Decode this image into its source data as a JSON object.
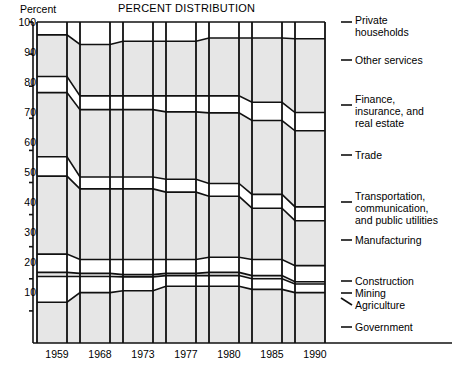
{
  "chart_data": {
    "type": "area",
    "title": "PERCENT DISTRIBUTION",
    "ylabel": "Percent",
    "xlabel": "",
    "grid": false,
    "legend_position": "right-inline-labels",
    "ylim": [
      0,
      100
    ],
    "yticks": [
      0,
      10,
      20,
      30,
      40,
      50,
      60,
      70,
      80,
      90,
      100
    ],
    "ytick_labels": [
      "",
      "10",
      "20",
      "30",
      "40",
      "50",
      "60",
      "70",
      "80",
      "90",
      "100"
    ],
    "categories": [
      "1959",
      "1968",
      "1973",
      "1977",
      "1980",
      "1985",
      "1990"
    ],
    "stack_order_bottom_to_top": [
      "Government",
      "Agriculture",
      "Mining",
      "Construction",
      "Manufacturing",
      "Transportation, communication, and public utilities",
      "Trade",
      "Finance, insurance, and real estate",
      "Other services",
      "Private households"
    ],
    "series": [
      {
        "name": "Government",
        "values": [
          12.7,
          15.7,
          16.3,
          17.7,
          17.7,
          16.7,
          15.7
        ]
      },
      {
        "name": "Agriculture",
        "values": [
          8.0,
          5.0,
          4.3,
          3.3,
          3.3,
          3.3,
          2.7
        ]
      },
      {
        "name": "Mining",
        "values": [
          1.3,
          1.0,
          0.7,
          0.7,
          1.0,
          1.0,
          0.7
        ]
      },
      {
        "name": "Construction",
        "values": [
          5.7,
          4.3,
          4.7,
          4.3,
          4.7,
          5.0,
          5.0
        ]
      },
      {
        "name": "Manufacturing",
        "values": [
          24.3,
          22.0,
          22.0,
          21.0,
          19.0,
          16.0,
          14.0
        ]
      },
      {
        "name": "Transportation, communication, and public utilities",
        "values": [
          6.0,
          3.7,
          3.7,
          4.0,
          4.0,
          4.3,
          4.3
        ]
      },
      {
        "name": "Trade",
        "values": [
          20.0,
          21.0,
          21.0,
          21.0,
          22.0,
          23.0,
          23.7
        ]
      },
      {
        "name": "Finance, insurance, and real estate",
        "values": [
          5.0,
          4.3,
          4.3,
          5.0,
          5.3,
          5.7,
          5.7
        ]
      },
      {
        "name": "Other services",
        "values": [
          13.0,
          16.0,
          17.0,
          17.0,
          18.0,
          20.0,
          23.0
        ]
      },
      {
        "name": "Private households",
        "values": [
          4.0,
          3.0,
          2.3,
          2.3,
          2.0,
          2.0,
          2.3
        ]
      }
    ],
    "cumulative_tops": [
      {
        "band": "Government",
        "tops": [
          12.7,
          15.7,
          16.3,
          17.7,
          17.7,
          16.7,
          15.7
        ]
      },
      {
        "band": "Agriculture",
        "tops": [
          20.7,
          20.7,
          20.6,
          21.0,
          21.0,
          20.0,
          18.4
        ]
      },
      {
        "band": "Mining",
        "tops": [
          22.0,
          21.7,
          21.3,
          21.7,
          22.0,
          21.0,
          19.1
        ]
      },
      {
        "band": "Construction",
        "tops": [
          27.7,
          26.0,
          26.0,
          26.0,
          26.7,
          26.0,
          24.1
        ]
      },
      {
        "band": "Manufacturing",
        "tops": [
          52.0,
          48.0,
          48.0,
          47.0,
          45.7,
          42.0,
          38.1
        ]
      },
      {
        "band": "Transportation",
        "tops": [
          58.0,
          51.7,
          51.7,
          51.0,
          49.7,
          46.3,
          42.4
        ]
      },
      {
        "band": "Trade",
        "tops": [
          78.0,
          72.7,
          72.7,
          72.0,
          71.7,
          69.3,
          66.1
        ]
      },
      {
        "band": "Finance",
        "tops": [
          83.0,
          77.0,
          77.0,
          77.0,
          77.0,
          75.0,
          71.8
        ]
      },
      {
        "band": "Other services",
        "tops": [
          96.0,
          93.0,
          94.0,
          94.0,
          95.0,
          95.0,
          94.8
        ]
      },
      {
        "band": "Private households",
        "tops": [
          100,
          100,
          100,
          100,
          100,
          100,
          100
        ]
      }
    ],
    "annotations": [
      {
        "label": "Private households",
        "lines": [
          "Private",
          "households"
        ]
      },
      {
        "label": "Other services",
        "lines": [
          "Other services"
        ]
      },
      {
        "label": "Finance, insurance, and real estate",
        "lines": [
          "Finance,",
          "insurance, and",
          "real estate"
        ]
      },
      {
        "label": "Trade",
        "lines": [
          "Trade"
        ]
      },
      {
        "label": "Transportation, communication, and public utilities",
        "lines": [
          "Transportation,",
          "communication,",
          "and public utilities"
        ]
      },
      {
        "label": "Manufacturing",
        "lines": [
          "Manufacturing"
        ]
      },
      {
        "label": "Construction",
        "lines": [
          "Construction"
        ]
      },
      {
        "label": "Mining",
        "lines": [
          "Mining"
        ]
      },
      {
        "label": "Agriculture",
        "lines": [
          "Agriculture"
        ]
      },
      {
        "label": "Government",
        "lines": [
          "Government"
        ]
      }
    ],
    "colors": {
      "band_fill_alt": "#e6e6e6",
      "band_fill_base": "#ffffff",
      "stroke": "#111111",
      "axis": "#111111",
      "text": "#111111"
    }
  },
  "labels": {
    "y_axis_title": "Percent",
    "chart_title": "PERCENT DISTRIBUTION",
    "tick_100": "100",
    "tick_90": "90",
    "tick_80": "80",
    "tick_70": "70",
    "tick_60": "60",
    "tick_50": "50",
    "tick_40": "40",
    "tick_30": "30",
    "tick_20": "20",
    "tick_10": "10",
    "year_1959": "1959",
    "year_1968": "1968",
    "year_1973": "1973",
    "year_1977": "1977",
    "year_1980": "1980",
    "year_1985": "1985",
    "year_1990": "1990",
    "cat_private_1": "Private",
    "cat_private_2": "households",
    "cat_other_services": "Other services",
    "cat_finance_1": "Finance,",
    "cat_finance_2": "insurance, and",
    "cat_finance_3": "real estate",
    "cat_trade": "Trade",
    "cat_transport_1": "Transportation,",
    "cat_transport_2": "communication,",
    "cat_transport_3": "and public utilities",
    "cat_manufacturing": "Manufacturing",
    "cat_construction": "Construction",
    "cat_mining": "Mining",
    "cat_agriculture": "Agriculture",
    "cat_government": "Government"
  }
}
